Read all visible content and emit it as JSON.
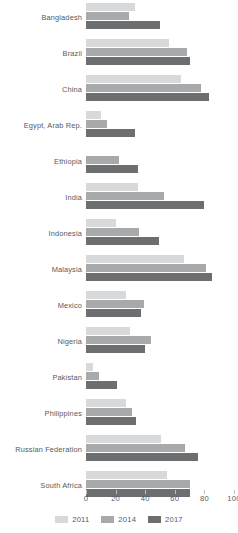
{
  "chart_data": {
    "type": "bar",
    "orientation": "horizontal",
    "title": "",
    "subtitle": "",
    "xlabel": "",
    "ylabel": "",
    "xlim": [
      0,
      100
    ],
    "xticks": [
      0,
      20,
      40,
      60,
      80,
      100
    ],
    "xtick_labels": [
      "0",
      "20",
      "40",
      "60",
      "80",
      "100"
    ],
    "grid": false,
    "legend_position": "bottom",
    "categories": [
      "Bangladesh",
      "Brazil",
      "China",
      "Egypt, Arab Rep.",
      "Ethiopia",
      "India",
      "Indonesia",
      "Malaysia",
      "Mexico",
      "Nigeria",
      "Pakistan",
      "Philippines",
      "Russian Federation",
      "South Africa"
    ],
    "series": [
      {
        "name": "2011",
        "color": "#d8d9da",
        "values": [
          33,
          56,
          64,
          10,
          0,
          35,
          20,
          66,
          27,
          30,
          5,
          27,
          51,
          55
        ]
      },
      {
        "name": "2014",
        "color": "#a7a9ab",
        "values": [
          29,
          68,
          78,
          14,
          22,
          53,
          36,
          81,
          39,
          44,
          9,
          31,
          67,
          70
        ]
      },
      {
        "name": "2017",
        "color": "#6d6e70",
        "values": [
          50,
          70,
          83,
          33,
          35,
          80,
          49,
          85,
          37,
          40,
          21,
          34,
          76,
          70
        ]
      }
    ]
  },
  "legend": {
    "items": [
      {
        "label": "2011",
        "color": "#d8d9da"
      },
      {
        "label": "2014",
        "color": "#a7a9ab"
      },
      {
        "label": "2017",
        "color": "#6d6e70"
      }
    ]
  },
  "colors": {
    "series_2011": "#d8d9da",
    "series_2014": "#a7a9ab",
    "series_2017": "#6d6e70",
    "text": "#58595b",
    "axis": "#bcbec0",
    "background": "#ffffff"
  }
}
